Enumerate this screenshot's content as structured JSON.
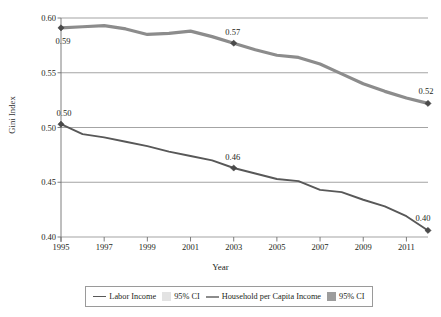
{
  "chart_data": {
    "type": "line",
    "title": "",
    "xlabel": "Year",
    "ylabel": "Gini Index",
    "xlim": [
      1995,
      2012
    ],
    "ylim": [
      0.4,
      0.6
    ],
    "grid": true,
    "legend_position": "bottom",
    "y_ticks": [
      "0.60",
      "0.55",
      "0.50",
      "0.45",
      "0.40"
    ],
    "y_tick_values": [
      0.6,
      0.55,
      0.5,
      0.45,
      0.4
    ],
    "x_ticks": [
      "1995",
      "1997",
      "1999",
      "2001",
      "2003",
      "2005",
      "2007",
      "2009",
      "2011"
    ],
    "x_tick_values": [
      1995,
      1997,
      1999,
      2001,
      2003,
      2005,
      2007,
      2009,
      2011
    ],
    "x": [
      1995,
      1996,
      1997,
      1998,
      1999,
      2000,
      2001,
      2002,
      2003,
      2004,
      2005,
      2006,
      2007,
      2008,
      2009,
      2010,
      2011,
      2012
    ],
    "series": [
      {
        "name": "Household per Capita Income",
        "color": "#8c8c8c",
        "width": 3.2,
        "values": [
          0.591,
          0.592,
          0.593,
          0.59,
          0.585,
          0.586,
          0.588,
          0.583,
          0.577,
          0.571,
          0.566,
          0.564,
          0.558,
          0.549,
          0.54,
          0.533,
          0.527,
          0.522
        ]
      },
      {
        "name": "Labor Income",
        "color": "#585858",
        "width": 1.9,
        "values": [
          0.503,
          0.494,
          0.491,
          0.487,
          0.483,
          0.478,
          0.474,
          0.47,
          0.463,
          0.458,
          0.453,
          0.451,
          0.443,
          0.441,
          0.434,
          0.428,
          0.419,
          0.406
        ]
      }
    ],
    "annotations": [
      {
        "label": "0.59",
        "x": 1995,
        "y": 0.591,
        "series": "Household per Capita Income",
        "marker": true
      },
      {
        "label": "0.57",
        "x": 2003,
        "y": 0.577,
        "series": "Household per Capita Income",
        "marker": true
      },
      {
        "label": "0.52",
        "x": 2012,
        "y": 0.522,
        "series": "Household per Capita Income",
        "marker": true
      },
      {
        "label": "0.50",
        "x": 1995,
        "y": 0.503,
        "series": "Labor Income",
        "marker": true
      },
      {
        "label": "0.46",
        "x": 2003,
        "y": 0.463,
        "series": "Labor Income",
        "marker": true
      },
      {
        "label": "0.40",
        "x": 2012,
        "y": 0.406,
        "series": "Labor Income",
        "marker": true
      }
    ],
    "legend": [
      {
        "label": "Labor Income",
        "type": "line",
        "color": "#585858"
      },
      {
        "label": "95% CI",
        "type": "swatch",
        "color": "#e3e3e3"
      },
      {
        "label": "Household per Capita Income",
        "type": "line",
        "color": "#8c8c8c"
      },
      {
        "label": "95% CI",
        "type": "swatch",
        "color": "#9d9d9d"
      }
    ]
  },
  "colors": {
    "axis": "#6f6f6f",
    "grid": "#7d7d7d",
    "text": "#231f20",
    "background": "#ffffff"
  }
}
